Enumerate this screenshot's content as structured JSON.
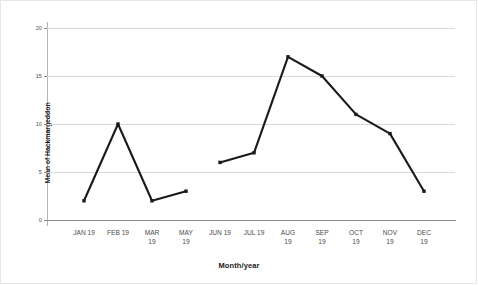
{
  "chart_data": {
    "type": "line",
    "title": "",
    "xlabel": "Month/year",
    "ylabel": "Mean of Hackmargeddon",
    "categories": [
      "JAN 19",
      "FEB 19",
      "MAR 19",
      "MAY 19",
      "JUN 19",
      "JUL 19",
      "AUG 19",
      "SEP 19",
      "OCT 19",
      "NOV 19",
      "DEC 19"
    ],
    "values": [
      2,
      10,
      2,
      3,
      6,
      7,
      17,
      15,
      11,
      9,
      3
    ],
    "series": [
      {
        "name": "Mean of Hackmargeddon",
        "values": [
          2,
          10,
          2,
          3,
          6,
          7,
          17,
          15,
          11,
          9,
          3
        ]
      }
    ],
    "segments": [
      {
        "start_index": 0,
        "end_index": 3
      },
      {
        "start_index": 4,
        "end_index": 10
      }
    ],
    "ylim": [
      0,
      20
    ],
    "yticks": [
      0,
      5,
      10,
      15,
      20
    ],
    "ytick_labels": [
      "0",
      "5",
      "10",
      "15",
      "20"
    ],
    "grid": true,
    "grid_axis": "y",
    "legend": "none",
    "line_color": "#1a1a1a",
    "marker": "square",
    "background_color": "#ffffff",
    "gridline_color": "#d9d9d9"
  },
  "axis": {
    "y_title": "Mean of Hackmargeddon",
    "x_title": "Month/year",
    "y_ticks": [
      {
        "label": "20",
        "value": 20
      },
      {
        "label": "15",
        "value": 15
      },
      {
        "label": "10",
        "value": 10
      },
      {
        "label": "5",
        "value": 5
      },
      {
        "label": "0",
        "value": 0
      }
    ],
    "x_ticks": [
      {
        "label": "JAN 19"
      },
      {
        "label": "FEB 19"
      },
      {
        "label": "MAR\n19"
      },
      {
        "label": "MAY\n19"
      },
      {
        "label": "JUN 19"
      },
      {
        "label": "JUL 19"
      },
      {
        "label": "AUG\n19"
      },
      {
        "label": "SEP\n19"
      },
      {
        "label": "OCT\n19"
      },
      {
        "label": "NOV\n19"
      },
      {
        "label": "DEC\n19"
      }
    ]
  }
}
